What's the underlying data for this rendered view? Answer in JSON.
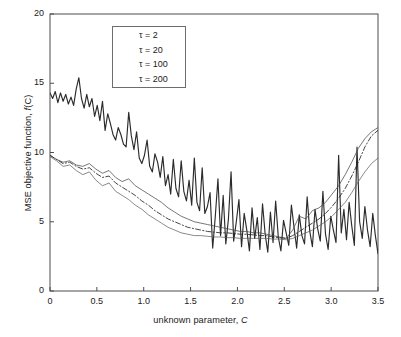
{
  "chart_data": {
    "type": "line",
    "title": "",
    "xlabel": "unknown parameter, C",
    "ylabel": "MSE objective function, f(C)",
    "xlim": [
      0,
      3.5
    ],
    "ylim": [
      0,
      20
    ],
    "grid": false,
    "legend_position": "top-left-inside",
    "xticks": [
      "0",
      "0.5",
      "1.0",
      "1.5",
      "2.0",
      "2.5",
      "3.0",
      "3.5"
    ],
    "xtick_values": [
      0,
      0.5,
      1.0,
      1.5,
      2.0,
      2.5,
      3.0,
      3.5
    ],
    "yticks": [
      "0",
      "5",
      "10",
      "15",
      "20"
    ],
    "ytick_values": [
      0,
      5,
      10,
      15,
      20
    ],
    "series": [
      {
        "name": "tau = 2",
        "legend_label": "τ = 2",
        "style": "solid",
        "width": 1.15,
        "color": "#2b2b2b",
        "x": [
          0,
          0.028,
          0.056,
          0.084,
          0.112,
          0.14,
          0.168,
          0.196,
          0.224,
          0.252,
          0.28,
          0.308,
          0.336,
          0.364,
          0.392,
          0.42,
          0.448,
          0.476,
          0.504,
          0.532,
          0.56,
          0.588,
          0.616,
          0.644,
          0.672,
          0.7,
          0.728,
          0.756,
          0.784,
          0.812,
          0.84,
          0.868,
          0.896,
          0.924,
          0.952,
          0.98,
          1.008,
          1.036,
          1.064,
          1.092,
          1.12,
          1.148,
          1.176,
          1.204,
          1.232,
          1.26,
          1.288,
          1.316,
          1.344,
          1.372,
          1.4,
          1.428,
          1.456,
          1.484,
          1.512,
          1.54,
          1.568,
          1.596,
          1.624,
          1.652,
          1.68,
          1.708,
          1.736,
          1.764,
          1.792,
          1.82,
          1.848,
          1.876,
          1.904,
          1.932,
          1.96,
          1.988,
          2.016,
          2.044,
          2.072,
          2.1,
          2.128,
          2.156,
          2.184,
          2.212,
          2.24,
          2.268,
          2.296,
          2.324,
          2.352,
          2.38,
          2.408,
          2.436,
          2.464,
          2.492,
          2.52,
          2.548,
          2.576,
          2.604,
          2.632,
          2.66,
          2.688,
          2.716,
          2.744,
          2.772,
          2.8,
          2.828,
          2.856,
          2.884,
          2.912,
          2.94,
          2.968,
          2.996,
          3.024,
          3.052,
          3.08,
          3.108,
          3.136,
          3.164,
          3.192,
          3.22,
          3.248,
          3.276,
          3.304,
          3.332,
          3.36,
          3.388,
          3.416,
          3.444,
          3.472,
          3.5
        ],
        "y": [
          14.3,
          13.9,
          14.4,
          13.6,
          14.3,
          13.7,
          14.2,
          13.5,
          14.0,
          13.4,
          14.6,
          15.4,
          13.9,
          13.2,
          14.2,
          13.3,
          13.9,
          12.6,
          13.4,
          12.3,
          13.7,
          11.6,
          12.8,
          12.1,
          11.3,
          10.9,
          11.8,
          11.3,
          10.6,
          10.4,
          12.9,
          11.2,
          10.2,
          11.5,
          9.6,
          9.2,
          9.8,
          10.9,
          9.0,
          8.6,
          9.9,
          9.3,
          8.2,
          9.7,
          7.6,
          8.4,
          7.0,
          9.5,
          7.4,
          6.8,
          9.4,
          7.2,
          6.5,
          8.0,
          6.2,
          9.6,
          6.4,
          5.8,
          8.9,
          5.6,
          6.1,
          7.1,
          3.1,
          5.4,
          8.1,
          4.0,
          6.9,
          3.4,
          5.2,
          8.6,
          3.6,
          5.0,
          6.6,
          3.2,
          5.6,
          4.4,
          2.9,
          6.0,
          3.8,
          5.3,
          3.0,
          6.3,
          4.1,
          2.8,
          5.7,
          3.5,
          6.5,
          3.9,
          2.9,
          5.1,
          4.2,
          3.3,
          6.2,
          4.6,
          3.1,
          5.5,
          4.0,
          3.4,
          6.8,
          4.3,
          3.2,
          5.9,
          4.5,
          3.6,
          7.2,
          4.1,
          3.0,
          5.4,
          4.4,
          3.5,
          9.8,
          4.2,
          5.9,
          3.7,
          6.4,
          4.7,
          3.3,
          10.4,
          5.0,
          3.8,
          6.1,
          4.4,
          3.2,
          5.6,
          4.0,
          2.7
        ]
      },
      {
        "name": "tau = 20",
        "legend_label": "τ = 20",
        "style": "solid",
        "width": 0.75,
        "color": "#4a4a4a",
        "x": [
          0,
          0.07,
          0.14,
          0.21,
          0.28,
          0.35,
          0.42,
          0.49,
          0.56,
          0.63,
          0.7,
          0.77,
          0.84,
          0.91,
          0.98,
          1.05,
          1.12,
          1.19,
          1.26,
          1.33,
          1.4,
          1.47,
          1.54,
          1.61,
          1.68,
          1.75,
          1.82,
          1.89,
          1.96,
          2.03,
          2.1,
          2.17,
          2.24,
          2.31,
          2.38,
          2.45,
          2.52,
          2.59,
          2.66,
          2.73,
          2.8,
          2.87,
          2.94,
          3.01,
          3.08,
          3.15,
          3.22,
          3.29,
          3.36,
          3.43,
          3.5
        ],
        "y": [
          9.8,
          9.5,
          9.3,
          9.4,
          9.1,
          9.0,
          9.2,
          8.8,
          8.5,
          8.7,
          8.2,
          7.9,
          8.1,
          7.6,
          7.3,
          7.0,
          6.7,
          6.4,
          6.0,
          5.7,
          5.4,
          5.2,
          5.0,
          4.9,
          4.8,
          4.7,
          4.6,
          4.5,
          4.4,
          4.3,
          4.3,
          4.2,
          4.2,
          4.1,
          4.0,
          3.9,
          3.8,
          4.4,
          5.4,
          5.2,
          5.8,
          6.0,
          6.4,
          7.0,
          7.6,
          8.4,
          9.3,
          10.3,
          11.0,
          11.5,
          11.8
        ]
      },
      {
        "name": "tau = 100",
        "legend_label": "τ = 100",
        "style": "dashdot",
        "width": 0.85,
        "color": "#262626",
        "x": [
          0,
          0.07,
          0.14,
          0.21,
          0.28,
          0.35,
          0.42,
          0.49,
          0.56,
          0.63,
          0.7,
          0.77,
          0.84,
          0.91,
          0.98,
          1.05,
          1.12,
          1.19,
          1.26,
          1.33,
          1.4,
          1.47,
          1.54,
          1.61,
          1.68,
          1.75,
          1.82,
          1.89,
          1.96,
          2.03,
          2.1,
          2.17,
          2.24,
          2.31,
          2.38,
          2.45,
          2.52,
          2.59,
          2.66,
          2.73,
          2.8,
          2.87,
          2.94,
          3.01,
          3.08,
          3.15,
          3.22,
          3.29,
          3.36,
          3.43,
          3.5
        ],
        "y": [
          9.8,
          9.5,
          9.2,
          9.3,
          9.0,
          8.8,
          8.9,
          8.5,
          8.2,
          8.3,
          7.8,
          7.5,
          7.2,
          6.9,
          6.5,
          6.2,
          5.8,
          5.5,
          5.2,
          5.0,
          4.8,
          4.6,
          4.5,
          4.4,
          4.3,
          4.25,
          4.2,
          4.2,
          4.15,
          4.1,
          4.1,
          4.05,
          4.0,
          4.0,
          3.9,
          3.85,
          3.8,
          4.0,
          4.3,
          4.6,
          4.9,
          5.2,
          5.6,
          6.1,
          6.7,
          7.4,
          8.3,
          9.3,
          10.4,
          11.2,
          11.6
        ]
      },
      {
        "name": "tau = 200",
        "legend_label": "τ = 200",
        "style": "solid",
        "width": 0.7,
        "color": "#575757",
        "x": [
          0,
          0.07,
          0.14,
          0.21,
          0.28,
          0.35,
          0.42,
          0.49,
          0.56,
          0.63,
          0.7,
          0.77,
          0.84,
          0.91,
          0.98,
          1.05,
          1.12,
          1.19,
          1.26,
          1.33,
          1.4,
          1.47,
          1.54,
          1.61,
          1.68,
          1.75,
          1.82,
          1.89,
          1.96,
          2.03,
          2.1,
          2.17,
          2.24,
          2.31,
          2.38,
          2.45,
          2.52,
          2.59,
          2.66,
          2.73,
          2.8,
          2.87,
          2.94,
          3.01,
          3.08,
          3.15,
          3.22,
          3.29,
          3.36,
          3.43,
          3.5
        ],
        "y": [
          9.7,
          9.4,
          9.0,
          9.1,
          8.7,
          8.4,
          8.6,
          8.0,
          7.6,
          7.8,
          7.2,
          6.9,
          6.6,
          6.2,
          5.9,
          5.5,
          5.2,
          4.9,
          4.6,
          4.4,
          4.2,
          4.1,
          4.0,
          4.0,
          3.95,
          3.9,
          3.9,
          3.85,
          3.85,
          3.8,
          3.8,
          3.8,
          3.8,
          3.8,
          3.75,
          3.75,
          3.7,
          3.8,
          4.0,
          4.2,
          4.4,
          4.7,
          5.0,
          5.4,
          5.9,
          6.4,
          7.1,
          7.9,
          8.6,
          9.2,
          9.6
        ]
      }
    ]
  },
  "axes": {
    "frame_color": "#4d4d4d",
    "background": "#ffffff"
  }
}
